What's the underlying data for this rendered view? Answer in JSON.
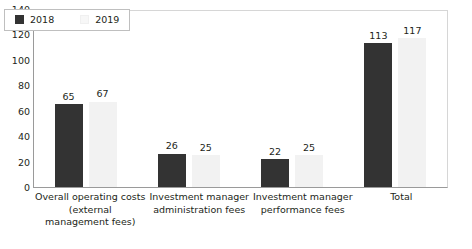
{
  "chart_data": {
    "type": "bar",
    "title": "",
    "xlabel": "",
    "ylabel": "",
    "ylim": [
      0,
      140
    ],
    "ytick_step": 20,
    "yticks": [
      "140",
      "120",
      "100",
      "80",
      "60",
      "40",
      "20",
      "0"
    ],
    "grid": false,
    "legend_position": "top-left-inside",
    "categories": [
      "Overall operating costs (external management fees)",
      "Investment manager administration fees",
      "Investment manager performance fees",
      "Total"
    ],
    "category_lines": [
      [
        "Overall operating costs",
        "(external",
        "management fees)"
      ],
      [
        "Investment manager",
        "administration fees"
      ],
      [
        "Investment manager",
        "performance fees"
      ],
      [
        "Total"
      ]
    ],
    "series": [
      {
        "name": "2018",
        "color": "#333333",
        "values": [
          65,
          26,
          22,
          113
        ]
      },
      {
        "name": "2019",
        "color": "#F2F2F2",
        "values": [
          67,
          25,
          25,
          117
        ]
      }
    ]
  },
  "legend": {
    "items": [
      {
        "label": "2018",
        "swatch": "legend-swatch-2018"
      },
      {
        "label": "2019",
        "swatch": "legend-swatch-2019"
      }
    ]
  }
}
